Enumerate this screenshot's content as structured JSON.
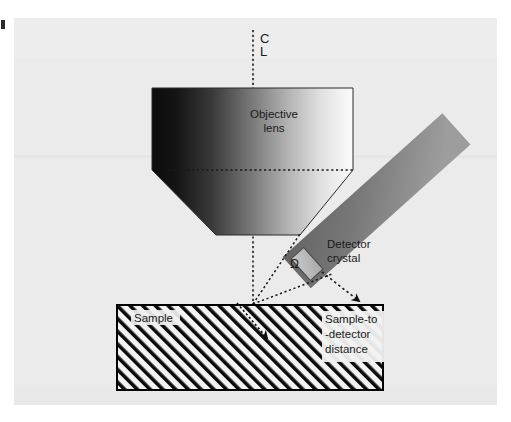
{
  "figure": {
    "kind": "technical-diagram",
    "canvas": {
      "background_color": "#ffffff",
      "plate_color": "#ebebeb",
      "width": 511,
      "height": 422
    }
  },
  "labels": {
    "centerline_top": "C",
    "centerline_bottom": "L",
    "objective_lens_line1": "Objective",
    "objective_lens_line2": "lens",
    "detector_crystal_line1": "Detector",
    "detector_crystal_line2": "crystal",
    "solid_angle_symbol": "Ω",
    "sample": "Sample",
    "distance_line1": "Sample-to",
    "distance_line2": "-detector",
    "distance_line3": "distance"
  },
  "colors": {
    "lens_gradient_dark": "#111111",
    "lens_gradient_light": "#fbfbfb",
    "detector_bar_gradient_dark": "#5f5f5f",
    "detector_bar_gradient_light": "#9a9a9a",
    "detector_crystal_fill": "#b9b9b9",
    "sample_hatch_line": "#000000",
    "sample_fill": "#f2f2f2",
    "outline": "#000000",
    "dotted_line": "#1a1a1a",
    "text": "#1a1a1a"
  },
  "geometry": {
    "centerline_x": 253,
    "centerline_top_y": 30,
    "centerline_bottom_y": 305,
    "lens_polygon": "152,88 353,88 353,170 300,235 216,235 152,170",
    "lens_horizontal_dotted_y": 170,
    "detector_bar_angle_deg": -42,
    "detector_crystal_center": "313,258",
    "sample_rect": "117,305 266x85",
    "sample_surface_point": "253,304",
    "ray_left_target": "298,240",
    "ray_right_target": "331,272",
    "distance_arrow_from": "325,275",
    "distance_arrow_to": "362,305"
  }
}
